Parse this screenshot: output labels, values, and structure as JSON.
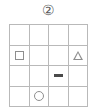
{
  "figure": {
    "label": "②",
    "label_name": "circled-number-two",
    "background_color": "#ffffff",
    "grid_line_color": "#b9b9b9",
    "shape_outline_color": "#8e8e8e",
    "marker_fill_color": "#4a4a4a"
  },
  "grid": {
    "rows": 4,
    "columns": 4,
    "cells": [
      {
        "row": 1,
        "col": 1,
        "shape": "empty"
      },
      {
        "row": 1,
        "col": 2,
        "shape": "empty"
      },
      {
        "row": 1,
        "col": 3,
        "shape": "empty"
      },
      {
        "row": 1,
        "col": 4,
        "shape": "empty"
      },
      {
        "row": 2,
        "col": 1,
        "shape": "square"
      },
      {
        "row": 2,
        "col": 2,
        "shape": "empty"
      },
      {
        "row": 2,
        "col": 3,
        "shape": "empty"
      },
      {
        "row": 2,
        "col": 4,
        "shape": "triangle"
      },
      {
        "row": 3,
        "col": 1,
        "shape": "empty"
      },
      {
        "row": 3,
        "col": 2,
        "shape": "empty"
      },
      {
        "row": 3,
        "col": 3,
        "shape": "bar"
      },
      {
        "row": 3,
        "col": 4,
        "shape": "empty"
      },
      {
        "row": 4,
        "col": 1,
        "shape": "empty"
      },
      {
        "row": 4,
        "col": 2,
        "shape": "circle"
      },
      {
        "row": 4,
        "col": 3,
        "shape": "empty"
      },
      {
        "row": 4,
        "col": 4,
        "shape": "empty"
      }
    ]
  }
}
